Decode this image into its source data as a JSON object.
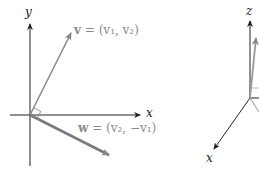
{
  "left_diagram": {
    "axes": {
      "x_label": "x",
      "y_label": "y"
    },
    "vectors": [
      {
        "name": "v",
        "label": "v = (v₁, v₂)",
        "bold": "v",
        "rest": " = (v₁, v₂)"
      },
      {
        "name": "w",
        "label": "w = (v₂, −v₁)",
        "bold": "w",
        "rest": " = (v₂, −v₁)"
      }
    ],
    "right_angle_marker": true
  },
  "right_diagram": {
    "axes": {
      "x_label": "x",
      "z_label": "z"
    }
  },
  "colors": {
    "axis": "#222222",
    "vector": "#888888",
    "vector_w": "#7a7a7a",
    "background": "#ffffff"
  }
}
